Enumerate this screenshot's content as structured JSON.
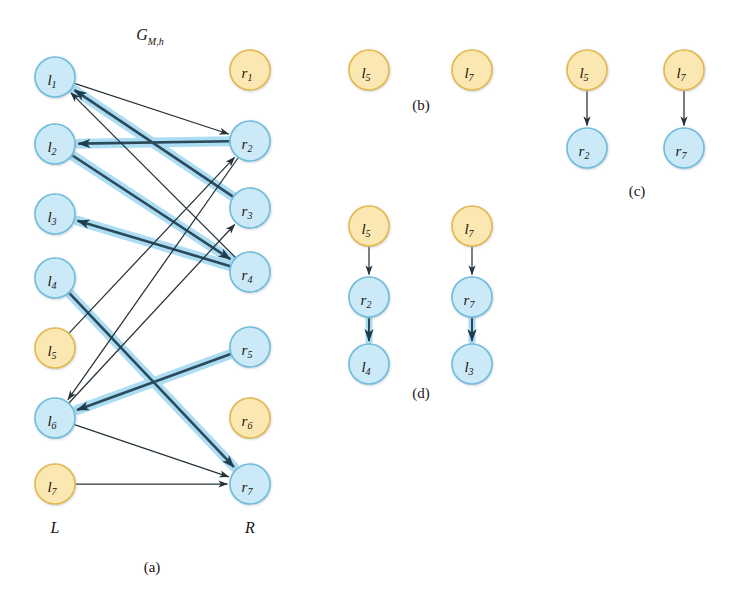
{
  "figure": {
    "title": "G",
    "title_sub": "M,h",
    "colors": {
      "node_blue_fill": "#cce9f7",
      "node_blue_stroke": "#6fbcdd",
      "node_yellow_fill": "#fbe7b2",
      "node_yellow_stroke": "#e4b84a",
      "edge_thin": "#26323a",
      "edge_thick": "#2b4a5c",
      "edge_highlight": "#a9dcf2",
      "text": "#1a1410",
      "background": "#ffffff"
    },
    "node_radius": 20,
    "small_node_radius": 19
  },
  "panel_a": {
    "caption": "(a)",
    "left_column_label": "L",
    "right_column_label": "R",
    "left_nodes": [
      {
        "id": "l1",
        "base": "l",
        "sub": "1",
        "color": "blue",
        "cx": 55,
        "cy": 77
      },
      {
        "id": "l2",
        "base": "l",
        "sub": "2",
        "color": "blue",
        "cx": 55,
        "cy": 144
      },
      {
        "id": "l3",
        "base": "l",
        "sub": "3",
        "color": "blue",
        "cx": 55,
        "cy": 214
      },
      {
        "id": "l4",
        "base": "l",
        "sub": "4",
        "color": "blue",
        "cx": 55,
        "cy": 278
      },
      {
        "id": "l5",
        "base": "l",
        "sub": "5",
        "color": "yellow",
        "cx": 55,
        "cy": 348
      },
      {
        "id": "l6",
        "base": "l",
        "sub": "6",
        "color": "blue",
        "cx": 55,
        "cy": 418
      },
      {
        "id": "l7",
        "base": "l",
        "sub": "7",
        "color": "yellow",
        "cx": 55,
        "cy": 484
      }
    ],
    "right_nodes": [
      {
        "id": "r1",
        "base": "r",
        "sub": "1",
        "color": "yellow",
        "cx": 250,
        "cy": 70
      },
      {
        "id": "r2",
        "base": "r",
        "sub": "2",
        "color": "blue",
        "cx": 250,
        "cy": 141
      },
      {
        "id": "r3",
        "base": "r",
        "sub": "3",
        "color": "blue",
        "cx": 250,
        "cy": 208
      },
      {
        "id": "r4",
        "base": "r",
        "sub": "4",
        "color": "blue",
        "cx": 250,
        "cy": 272
      },
      {
        "id": "r5",
        "base": "r",
        "sub": "5",
        "color": "blue",
        "cx": 250,
        "cy": 347
      },
      {
        "id": "r6",
        "base": "r",
        "sub": "6",
        "color": "yellow",
        "cx": 250,
        "cy": 418
      },
      {
        "id": "r7",
        "base": "r",
        "sub": "7",
        "color": "blue",
        "cx": 250,
        "cy": 484
      }
    ],
    "edges_thin": [
      {
        "from": "l1",
        "to": "r2",
        "label": "l1-to-r2"
      },
      {
        "from": "r4",
        "to": "l1",
        "label": "r4-to-l1"
      },
      {
        "from": "r2",
        "to": "l6",
        "label": "r2-to-l6"
      },
      {
        "from": "l5",
        "to": "r2",
        "label": "l5-to-r2"
      },
      {
        "from": "l6",
        "to": "r3",
        "label": "l6-to-r3"
      },
      {
        "from": "l6",
        "to": "r7",
        "label": "l6-to-r7"
      },
      {
        "from": "l7",
        "to": "r7",
        "label": "l7-to-r7"
      }
    ],
    "edges_thick": [
      {
        "from": "r3",
        "to": "l1",
        "label": "r3-to-l1"
      },
      {
        "from": "r2",
        "to": "l2",
        "label": "r2-to-l2"
      },
      {
        "from": "l2",
        "to": "r4",
        "label": "l2-to-r4"
      },
      {
        "from": "r4",
        "to": "l3",
        "label": "r4-to-l3"
      },
      {
        "from": "l4",
        "to": "r7",
        "label": "l4-to-r7"
      },
      {
        "from": "r5",
        "to": "l6",
        "label": "r5-to-l6"
      }
    ]
  },
  "panel_b": {
    "caption": "(b)",
    "nodes": [
      {
        "id": "b-l5",
        "base": "l",
        "sub": "5",
        "color": "yellow",
        "cx": 369,
        "cy": 70
      },
      {
        "id": "b-l7",
        "base": "l",
        "sub": "7",
        "color": "yellow",
        "cx": 472,
        "cy": 70
      }
    ],
    "edges": [],
    "caption_x": 421,
    "caption_y": 110
  },
  "panel_c": {
    "caption": "(c)",
    "nodes": [
      {
        "id": "c-l5",
        "base": "l",
        "sub": "5",
        "color": "yellow",
        "cx": 587,
        "cy": 70
      },
      {
        "id": "c-r2",
        "base": "r",
        "sub": "2",
        "color": "blue",
        "cx": 587,
        "cy": 148
      },
      {
        "id": "c-l7",
        "base": "l",
        "sub": "7",
        "color": "yellow",
        "cx": 684,
        "cy": 70
      },
      {
        "id": "c-r7",
        "base": "r",
        "sub": "7",
        "color": "blue",
        "cx": 684,
        "cy": 148
      }
    ],
    "edges": [
      {
        "from": "c-l5",
        "to": "c-r2",
        "label": "l5-to-r2"
      },
      {
        "from": "c-l7",
        "to": "c-r7",
        "label": "l7-to-r7"
      }
    ],
    "caption_x": 637,
    "caption_y": 196
  },
  "panel_d": {
    "caption": "(d)",
    "nodes": [
      {
        "id": "d-l5",
        "base": "l",
        "sub": "5",
        "color": "yellow",
        "cx": 369,
        "cy": 226
      },
      {
        "id": "d-r2",
        "base": "r",
        "sub": "2",
        "color": "blue",
        "cx": 369,
        "cy": 297
      },
      {
        "id": "d-l4",
        "base": "l",
        "sub": "4",
        "color": "blue",
        "cx": 369,
        "cy": 364
      },
      {
        "id": "d-l7",
        "base": "l",
        "sub": "7",
        "color": "yellow",
        "cx": 472,
        "cy": 226
      },
      {
        "id": "d-r7",
        "base": "r",
        "sub": "7",
        "color": "blue",
        "cx": 472,
        "cy": 297
      },
      {
        "id": "d-l3",
        "base": "l",
        "sub": "3",
        "color": "blue",
        "cx": 472,
        "cy": 364
      }
    ],
    "edges_thin": [
      {
        "from": "d-l5",
        "to": "d-r2",
        "label": "l5-to-r2"
      },
      {
        "from": "d-l7",
        "to": "d-r7",
        "label": "l7-to-r7"
      }
    ],
    "edges_thick": [
      {
        "from": "d-r2",
        "to": "d-l4",
        "label": "r2-to-l4"
      },
      {
        "from": "d-r7",
        "to": "d-l3",
        "label": "r7-to-l3"
      }
    ],
    "caption_x": 421,
    "caption_y": 398
  }
}
